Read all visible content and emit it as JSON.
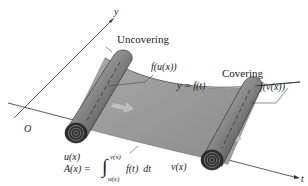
{
  "diagram": {
    "axes": {
      "vertical_label": "y",
      "horizontal_label": "t",
      "origin_label": "O"
    },
    "curve_label": "y = f(t)",
    "left_roll": {
      "caption": "Uncovering",
      "height_label": "f(u(x))",
      "position_label": "u(x)"
    },
    "right_roll": {
      "caption": "Covering",
      "height_label": "f(v(x))",
      "position_label": "v(x)"
    },
    "formula": {
      "lhs": "A(x) =",
      "upper_limit": "v(x)",
      "lower_limit": "u(x)",
      "integrand": "f(t)  dt"
    },
    "colors": {
      "sheet": "#9a9a9a",
      "roll_dark": "#3a3a3a",
      "roll_light": "#bdbdbd",
      "arrow": "#b8b8b8",
      "line": "#333333"
    }
  }
}
